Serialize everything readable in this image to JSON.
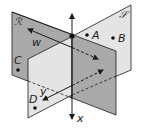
{
  "diagram": {
    "type": "two intersecting planes",
    "planes": [
      {
        "name": "R",
        "label": "ℛ",
        "fill": "#a9a9a9",
        "corners": [
          [
            12,
            12
          ],
          [
            116,
            51
          ],
          [
            116,
            115
          ],
          [
            12,
            75
          ]
        ]
      },
      {
        "name": "S",
        "label": "𝒮",
        "fill": "#e4e4e4",
        "corners": [
          [
            28,
            59
          ],
          [
            131,
            5
          ],
          [
            131,
            70
          ],
          [
            28,
            118
          ]
        ]
      }
    ],
    "intersection_line": {
      "label": "x",
      "x": 72,
      "y_top": 13,
      "y_bottom": 119
    },
    "intersection_point": [
      72,
      36
    ],
    "vectors": [
      {
        "label": "w",
        "from": [
          28,
          29
        ],
        "to": [
          98,
          59
        ]
      },
      {
        "label": "y",
        "from": [
          103,
          70
        ],
        "to": [
          43,
          100
        ]
      }
    ],
    "points": [
      {
        "label": "A",
        "pos": [
          87,
          35
        ]
      },
      {
        "label": "B",
        "pos": [
          113,
          38
        ]
      },
      {
        "label": "C",
        "pos": [
          18,
          70
        ]
      },
      {
        "label": "D",
        "pos": [
          35,
          108
        ]
      }
    ],
    "colors": {
      "stroke": "#1a1a1a",
      "plane_r": "#a9a9a9",
      "plane_s": "#e4e4e4"
    }
  }
}
